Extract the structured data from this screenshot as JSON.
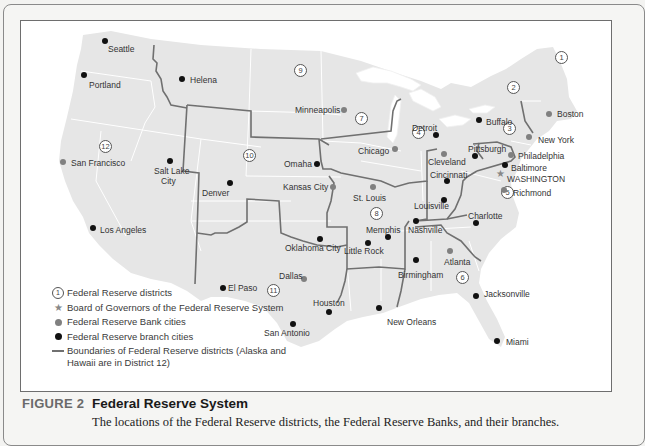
{
  "figure": {
    "label": "FIGURE 2",
    "title": "Federal Reserve System",
    "description": "The locations of the Federal Reserve districts, the Federal Reserve Banks, and their branches."
  },
  "colors": {
    "land": "#e6e6e6",
    "state_border": "#ffffff",
    "district_border": "#707070",
    "bank_city": "#808080",
    "branch_city": "#111111",
    "water": "#ffffff"
  },
  "legend": {
    "items": [
      {
        "symbol": "district-circle",
        "symbol_text": "1",
        "label": "Federal Reserve districts"
      },
      {
        "symbol": "star",
        "label": "Board of Governors of the Federal Reserve System"
      },
      {
        "symbol": "grey-dot",
        "label": "Federal Reserve Bank cities"
      },
      {
        "symbol": "black-dot",
        "label": "Federal Reserve branch cities"
      },
      {
        "symbol": "line",
        "label": "Boundaries of Federal Reserve districts (Alaska and Hawaii are in District 12)"
      }
    ]
  },
  "districts": [
    {
      "number": "1",
      "x": 560,
      "y": 56
    },
    {
      "number": "2",
      "x": 512,
      "y": 86
    },
    {
      "number": "3",
      "x": 508,
      "y": 127
    },
    {
      "number": "4",
      "x": 417,
      "y": 131
    },
    {
      "number": "5",
      "x": 506,
      "y": 191
    },
    {
      "number": "6",
      "x": 461,
      "y": 276
    },
    {
      "number": "7",
      "x": 360,
      "y": 117
    },
    {
      "number": "8",
      "x": 375,
      "y": 212
    },
    {
      "number": "9",
      "x": 299,
      "y": 69
    },
    {
      "number": "10",
      "x": 248,
      "y": 154
    },
    {
      "number": "11",
      "x": 272,
      "y": 289
    },
    {
      "number": "12",
      "x": 104,
      "y": 145
    }
  ],
  "cities": {
    "bank": [
      {
        "name": "Boston",
        "x": 548,
        "y": 113,
        "lx": 556,
        "ly": 116
      },
      {
        "name": "New York",
        "x": 528,
        "y": 136,
        "lx": 537,
        "ly": 142
      },
      {
        "name": "Philadelphia",
        "x": 510,
        "y": 154,
        "lx": 517,
        "ly": 158
      },
      {
        "name": "Cleveland",
        "x": 443,
        "y": 153,
        "lx": 427,
        "ly": 164
      },
      {
        "name": "Richmond",
        "x": 503,
        "y": 189,
        "lx": 512,
        "ly": 195
      },
      {
        "name": "Atlanta",
        "x": 449,
        "y": 250,
        "lx": 443,
        "ly": 264
      },
      {
        "name": "Chicago",
        "x": 394,
        "y": 148,
        "lx": 357,
        "ly": 153
      },
      {
        "name": "St. Louis",
        "x": 372,
        "y": 186,
        "lx": 352,
        "ly": 200
      },
      {
        "name": "Minneapolis",
        "x": 343,
        "y": 109,
        "lx": 294,
        "ly": 112
      },
      {
        "name": "Kansas City",
        "x": 332,
        "y": 186,
        "lx": 282,
        "ly": 189
      },
      {
        "name": "Dallas",
        "x": 303,
        "y": 278,
        "lx": 278,
        "ly": 278
      },
      {
        "name": "San Francisco",
        "x": 62,
        "y": 161,
        "lx": 70,
        "ly": 165
      }
    ],
    "branch": [
      {
        "name": "Seattle",
        "x": 104,
        "y": 40,
        "lx": 107,
        "ly": 51
      },
      {
        "name": "Portland",
        "x": 83,
        "y": 74,
        "lx": 88,
        "ly": 87
      },
      {
        "name": "Helena",
        "x": 181,
        "y": 78,
        "lx": 189,
        "ly": 82
      },
      {
        "name": "Salt Lake City",
        "x": 169,
        "y": 160,
        "lx": 153,
        "ly": 173,
        "lx2": 160,
        "ly2": 183
      },
      {
        "name": "Denver",
        "x": 229,
        "y": 182,
        "lx": 201,
        "ly": 195
      },
      {
        "name": "Los Angeles",
        "x": 92,
        "y": 227,
        "lx": 99,
        "ly": 232
      },
      {
        "name": "Omaha",
        "x": 316,
        "y": 163,
        "lx": 283,
        "ly": 166
      },
      {
        "name": "Detroit",
        "x": 435,
        "y": 134,
        "lx": 411,
        "ly": 130
      },
      {
        "name": "Buffalo",
        "x": 478,
        "y": 119,
        "lx": 485,
        "ly": 124
      },
      {
        "name": "Pittsburgh",
        "x": 474,
        "y": 155,
        "lx": 467,
        "ly": 151
      },
      {
        "name": "Baltimore",
        "x": 504,
        "y": 164,
        "lx": 510,
        "ly": 170
      },
      {
        "name": "Cincinnati",
        "x": 446,
        "y": 180,
        "lx": 429,
        "ly": 177
      },
      {
        "name": "Louisville",
        "x": 443,
        "y": 199,
        "lx": 413,
        "ly": 208
      },
      {
        "name": "Memphis",
        "x": 387,
        "y": 236,
        "lx": 365,
        "ly": 232
      },
      {
        "name": "Little Rock",
        "x": 367,
        "y": 242,
        "lx": 343,
        "ly": 253
      },
      {
        "name": "Nashville",
        "x": 415,
        "y": 220,
        "lx": 407,
        "ly": 232
      },
      {
        "name": "Charlotte",
        "x": 475,
        "y": 222,
        "lx": 467,
        "ly": 218
      },
      {
        "name": "Birmingham",
        "x": 415,
        "y": 259,
        "lx": 397,
        "ly": 277
      },
      {
        "name": "Jacksonville",
        "x": 475,
        "y": 295,
        "lx": 483,
        "ly": 296
      },
      {
        "name": "Miami",
        "x": 496,
        "y": 340,
        "lx": 505,
        "ly": 344
      },
      {
        "name": "Oklahoma City",
        "x": 319,
        "y": 238,
        "lx": 284,
        "ly": 250
      },
      {
        "name": "El Paso",
        "x": 222,
        "y": 287,
        "lx": 227,
        "ly": 290
      },
      {
        "name": "Houston",
        "x": 328,
        "y": 311,
        "lx": 312,
        "ly": 305
      },
      {
        "name": "San Antonio",
        "x": 292,
        "y": 323,
        "lx": 263,
        "ly": 335
      },
      {
        "name": "New Orleans",
        "x": 378,
        "y": 307,
        "lx": 386,
        "ly": 324
      }
    ]
  },
  "board_of_governors": {
    "name": "WASHINGTON",
    "x": 499,
    "y": 173,
    "lx": 506,
    "ly": 181
  }
}
